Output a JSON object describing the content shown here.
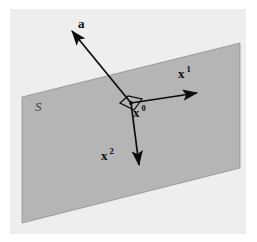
{
  "figure": {
    "kind": "geometry-diagram",
    "canvas": {
      "width": 257,
      "height": 242
    },
    "colors": {
      "page_background": "#ffffff",
      "panel_background": "#eeeeee",
      "plane_fill": "#b5b5b5",
      "plane_edge": "#8f8f8f",
      "vector_stroke": "#0b0b0b",
      "label_color": "#0b0b0b",
      "surface_label_color": "#3c3c3c"
    },
    "panel": {
      "x": 10,
      "y": 9,
      "width": 236,
      "height": 225
    },
    "plane": {
      "name": "S",
      "points": "22,97 240,43 240,168 22,223"
    },
    "origin": {
      "label": "x",
      "superscript": "0",
      "x": 131,
      "y": 103,
      "label_x": 133,
      "label_y": 117,
      "marker_points": "120,103 128,96 142,99 134,110",
      "dot_x": 131,
      "dot_y": 103
    },
    "vectors": [
      {
        "id": "vector-a",
        "label": "a",
        "superscript": "",
        "x1": 131,
        "y1": 103,
        "x2": 72,
        "y2": 31,
        "label_x": 78,
        "label_y": 28
      },
      {
        "id": "vector-x1",
        "label": "x",
        "superscript": "1",
        "x1": 131,
        "y1": 103,
        "x2": 197,
        "y2": 93,
        "label_x": 178,
        "label_y": 78
      },
      {
        "id": "vector-x2",
        "label": "x",
        "superscript": "2",
        "x1": 131,
        "y1": 103,
        "x2": 139,
        "y2": 165,
        "label_x": 101,
        "label_y": 160
      }
    ],
    "surface_label": {
      "text": "S",
      "x": 35,
      "y": 111
    }
  }
}
